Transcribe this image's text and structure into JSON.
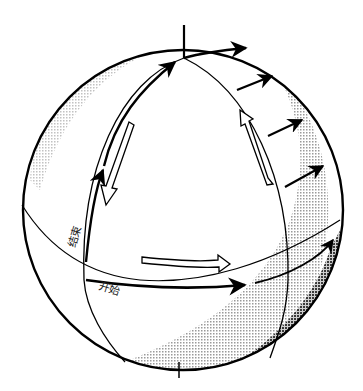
{
  "diagram": {
    "title": "",
    "labels": {
      "end": "结束",
      "start": "开始"
    },
    "colors": {
      "line": "#000000",
      "background": "#ffffff",
      "shade_light": "#d8d8d8",
      "shade_dark": "#7a7a7a"
    },
    "elements": {
      "sphere": "sphere-outline",
      "axis": "polar-axis",
      "equator": "equator-line",
      "meridians": [
        "meridian-left",
        "meridian-right"
      ],
      "path_arrows": [
        "equator-path-arrow",
        "up-meridian-arrow",
        "meridian-top-arrow"
      ],
      "transported_vectors": 5,
      "circulation_arrows": [
        "hollow-arrow-left-down",
        "hollow-arrow-bottom-right",
        "hollow-arrow-right-up"
      ]
    }
  }
}
